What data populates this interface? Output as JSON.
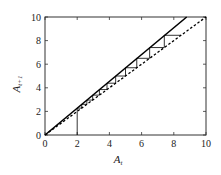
{
  "chart_data": {
    "type": "line",
    "title": "",
    "xlabel": "A_t",
    "ylabel": "A_{t+1}",
    "xlim": [
      0,
      10
    ],
    "ylim": [
      0,
      10
    ],
    "grid": false,
    "legend": null,
    "x_ticks": [
      0,
      2,
      4,
      6,
      8,
      10
    ],
    "y_ticks": [
      0,
      2,
      4,
      6,
      8,
      10
    ],
    "series": [
      {
        "name": "growth line A_{t+1} = 1.14 A_t",
        "style": "solid",
        "color": "#000000",
        "x": [
          0,
          8.8
        ],
        "y": [
          0,
          10
        ]
      },
      {
        "name": "identity line A_{t+1} = A_t",
        "style": "dashed",
        "color": "#000000",
        "x": [
          0,
          10
        ],
        "y": [
          0,
          10
        ]
      },
      {
        "name": "cobweb iteration from A_0 = 2",
        "style": "solid-thin",
        "color": "#000000",
        "start": 2,
        "lambda": 1.14,
        "values": [
          2.0,
          2.28,
          2.6,
          2.96,
          3.38,
          3.85,
          4.39,
          5.0,
          5.7,
          6.5,
          7.41,
          8.45
        ]
      }
    ]
  },
  "axes": {
    "x_label_main": "A",
    "x_label_sub": "t",
    "y_label_main": "A",
    "y_label_sub": "t+1"
  }
}
